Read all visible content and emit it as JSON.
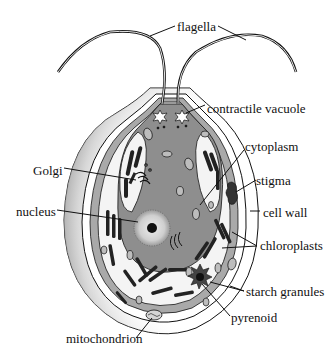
{
  "diagram": {
    "labels": {
      "flagella": "flagella",
      "contractile_vacuole": "contractile vacuole",
      "cytoplasm": "cytoplasm",
      "golgi": "Golgi",
      "stigma": "stigma",
      "nucleus": "nucleus",
      "cell_wall": "cell wall",
      "chloroplasts": "chloroplasts",
      "starch_granules": "starch granules",
      "pyrenoid": "pyrenoid",
      "mitochondrion": "mitochondrion"
    },
    "colors": {
      "background": "#ffffff",
      "cytoplasm": "#8e8e8e",
      "wall_band": "#a9a9a9",
      "chloroplast_bg": "#f4f4f4",
      "ink": "#111111",
      "nucleus": "#c9c9c9"
    }
  }
}
